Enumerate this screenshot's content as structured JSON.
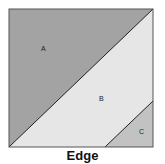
{
  "diagram": {
    "regions": [
      {
        "label": "A",
        "color": "#a3a3a3"
      },
      {
        "label": "B",
        "color": "#e6e6e6"
      },
      {
        "label": "C",
        "color": "#c2c2c2"
      }
    ],
    "caption": "Edge"
  }
}
